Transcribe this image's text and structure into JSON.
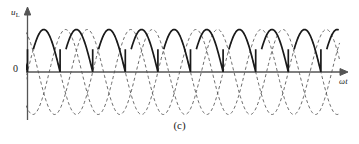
{
  "figure": {
    "caption": "(c)",
    "y_axis_label_main": "u",
    "y_axis_label_sub": "L",
    "x_axis_label": "ωt",
    "zero_tick_label": "0",
    "colors": {
      "axis": "#555555",
      "solid_waveform": "#1a1a1a",
      "dashed_waveform": "#5a5a5a",
      "background": "#ffffff",
      "text": "#1a1a1a"
    }
  },
  "chart_data": {
    "type": "line",
    "title": "",
    "subtitle": "",
    "xlabel": "ωt",
    "ylabel": "u_L",
    "caption": "(c)",
    "xlim": [
      0,
      10.3
    ],
    "ylim": [
      -1.12,
      1.12
    ],
    "grid": false,
    "legend": false,
    "legend_position": "none",
    "x_unit": "half-period (pi radians)",
    "annotations": [
      {
        "text": "0",
        "x": 0,
        "y": 0,
        "role": "zero-tick"
      },
      {
        "text": "(c)",
        "x": 5.0,
        "y": -1.45,
        "role": "figure-caption"
      }
    ],
    "axis_arrows": {
      "x": true,
      "y": true
    },
    "series": [
      {
        "name": "phase-a",
        "style": "dashed",
        "color": "#5a5a5a",
        "amplitude": 1.0,
        "phase_deg": 0,
        "period": 2.0,
        "description": "reference sine wave, full sinusoid shown dashed"
      },
      {
        "name": "phase-b",
        "style": "dashed",
        "color": "#5a5a5a",
        "amplitude": 1.0,
        "phase_deg": 120,
        "period": 2.0,
        "description": "second phase sine wave shifted 120 degrees, dashed"
      },
      {
        "name": "phase-c",
        "style": "dashed",
        "color": "#5a5a5a",
        "amplitude": 1.0,
        "phase_deg": 240,
        "period": 2.0,
        "description": "third phase sine wave shifted 240 degrees, dashed"
      },
      {
        "name": "load-voltage-uL",
        "style": "solid",
        "color": "#1a1a1a",
        "line_width": 1.6,
        "amplitude": 1.0,
        "segments": 10,
        "segment_span_deg": 180,
        "firing_angle_deg": 30,
        "description": "bold solid rectified output: each segment begins near the sine peak, decays along the sinusoid, then steps vertically back up to the next peak"
      }
    ],
    "zero_crossings_count": 10,
    "vertical_step_count": 9,
    "peak_value": 1.0,
    "trough_value": -1.0
  }
}
